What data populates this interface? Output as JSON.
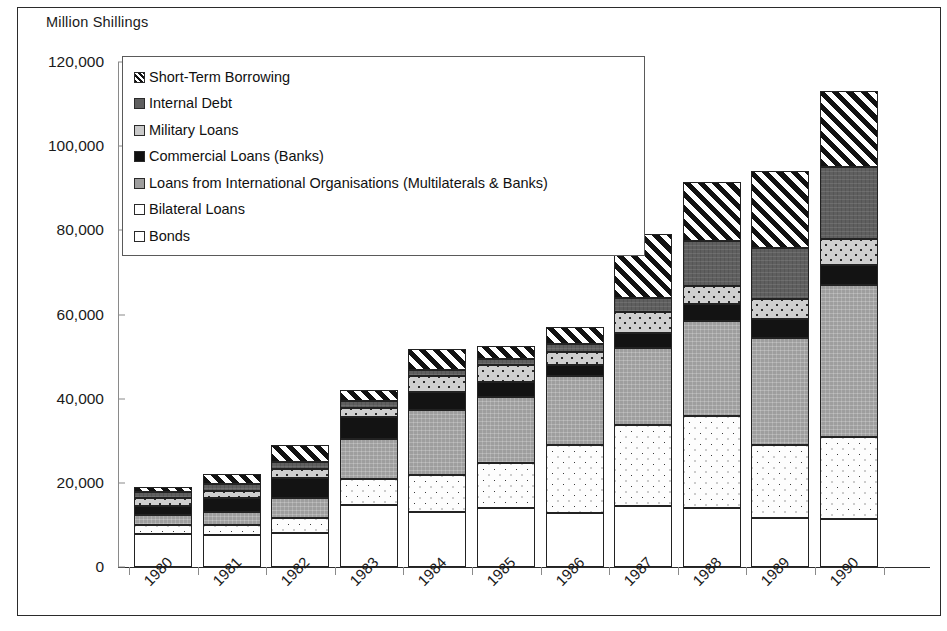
{
  "chart_data": {
    "type": "bar",
    "subtype": "stacked-bar",
    "title": "Million Shillings",
    "xlabel": "",
    "ylabel": "Million Shillings",
    "ylim": [
      0,
      120000
    ],
    "ytick_values": [
      0,
      20000,
      40000,
      60000,
      80000,
      100000,
      120000
    ],
    "ytick_labels": [
      "0",
      "20,000",
      "40,000",
      "60,000",
      "80,000",
      "100,000",
      "120,000"
    ],
    "grid": false,
    "legend_position": "upper-left-inside",
    "categories": [
      "1980",
      "1981",
      "1982",
      "1983",
      "1984",
      "1985",
      "1986",
      "1987",
      "1988",
      "1989",
      "1990"
    ],
    "stack_order_bottom_to_top": [
      "Bonds",
      "Bilateral Loans",
      "Loans from International Organisations (Multilaterals & Banks)",
      "Commercial Loans (Banks)",
      "Military Loans",
      "Internal Debt",
      "Short-Term Borrowing"
    ],
    "series": [
      {
        "name": "Bonds",
        "pattern": "solid-white",
        "values": [
          7800,
          7600,
          8000,
          14800,
          13000,
          14000,
          12900,
          14500,
          14000,
          11600,
          11500
        ]
      },
      {
        "name": "Bilateral Loans",
        "pattern": "dotted-white",
        "values": [
          2100,
          2400,
          3600,
          6200,
          8800,
          10600,
          16000,
          19300,
          21800,
          17300,
          19500
        ]
      },
      {
        "name": "Loans from International Organisations (Multilaterals & Banks)",
        "pattern": "solid-medium-gray",
        "values": [
          2500,
          3100,
          4700,
          9500,
          15500,
          15700,
          16500,
          18300,
          22700,
          25400,
          35900
        ]
      },
      {
        "name": "Commercial Loans (Banks)",
        "pattern": "solid-black",
        "values": [
          2200,
          3300,
          4900,
          5200,
          4200,
          3600,
          2600,
          3600,
          4100,
          4700,
          4800
        ]
      },
      {
        "name": "Military Loans",
        "pattern": "dotted-light-gray",
        "values": [
          1700,
          1700,
          2100,
          2100,
          3800,
          4200,
          3200,
          4800,
          4100,
          4700,
          6200
        ]
      },
      {
        "name": "Internal Debt",
        "pattern": "solid-dark-gray",
        "values": [
          1500,
          1600,
          1700,
          1700,
          1600,
          1400,
          1700,
          3500,
          10700,
          12000,
          17100
        ]
      },
      {
        "name": "Short-Term Borrowing",
        "pattern": "diagonal-hatch",
        "values": [
          1200,
          2300,
          4000,
          2500,
          4900,
          3100,
          4100,
          15200,
          14100,
          18300,
          18000
        ]
      }
    ],
    "totals": [
      19000,
      22000,
      29000,
      42000,
      51800,
      52600,
      57000,
      79200,
      91500,
      94000,
      113000
    ]
  },
  "legend": {
    "items": [
      {
        "label": "Short-Term Borrowing",
        "swatch": "diagonal-hatch-swatch"
      },
      {
        "label": "Internal Debt",
        "swatch": "dark-gray-swatch"
      },
      {
        "label": "Military Loans",
        "swatch": "light-gray-dotted-swatch"
      },
      {
        "label": "Commercial Loans (Banks)",
        "swatch": "black-swatch"
      },
      {
        "label": "Loans from International Organisations (Multilaterals & Banks)",
        "swatch": "medium-gray-swatch"
      },
      {
        "label": "Bilateral Loans",
        "swatch": "white-dotted-swatch"
      },
      {
        "label": "Bonds",
        "swatch": "white-swatch"
      }
    ]
  },
  "caption": {
    "text": ""
  },
  "colors": {
    "axis": "#8a8a8a",
    "frame": "#2b2b2b",
    "text": "#1a1a1a",
    "bonds": "#ffffff",
    "bilateral": "#fdfdfd",
    "international": "#9e9e9e",
    "commercial": "#131313",
    "military": "#cfcfcf",
    "internal": "#5f5f5f",
    "shortterm": "#ffffff"
  }
}
